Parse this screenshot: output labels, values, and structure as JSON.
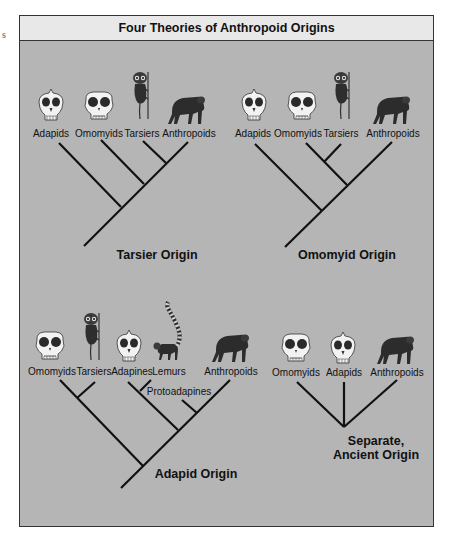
{
  "edge_fragment": "s",
  "title": "Four Theories of Anthropoid Origins",
  "colors": {
    "panel_bg": "#b5b5b5",
    "title_bg": "#e8e8e8",
    "line": "#111111"
  },
  "trees": [
    {
      "name": "Tarsier Origin",
      "taxa": [
        {
          "label": "Adapids",
          "icon": "adapid-skull-icon"
        },
        {
          "label": "Omomyids",
          "icon": "omomyid-skull-icon"
        },
        {
          "label": "Tarsiers",
          "icon": "tarsier-icon"
        },
        {
          "label": "Anthropoids",
          "icon": "chimpanzee-icon"
        }
      ],
      "topology": "(Adapids,(Omomyids,(Tarsiers,Anthropoids)))"
    },
    {
      "name": "Omomyid Origin",
      "taxa": [
        {
          "label": "Adapids",
          "icon": "adapid-skull-icon"
        },
        {
          "label": "Omomyids",
          "icon": "omomyid-skull-icon"
        },
        {
          "label": "Tarsiers",
          "icon": "tarsier-icon"
        },
        {
          "label": "Anthropoids",
          "icon": "chimpanzee-icon"
        }
      ],
      "topology": "(Adapids,((Omomyids,Tarsiers),Anthropoids))"
    },
    {
      "name": "Adapid Origin",
      "taxa": [
        {
          "label": "Omomyids",
          "icon": "omomyid-skull-icon"
        },
        {
          "label": "Tarsiers",
          "icon": "tarsier-icon"
        },
        {
          "label": "Adapines",
          "icon": "adapid-skull-icon"
        },
        {
          "label": "Lemurs",
          "icon": "lemur-icon"
        },
        {
          "label": "Anthropoids",
          "icon": "chimpanzee-icon"
        }
      ],
      "internal_label": "Protoadapines",
      "topology": "((Omomyids,Tarsiers),((Adapines,Lemurs),(Protoadapines,Anthropoids)))"
    },
    {
      "name_line1": "Separate,",
      "name_line2": "Ancient Origin",
      "taxa": [
        {
          "label": "Omomyids",
          "icon": "omomyid-skull-icon"
        },
        {
          "label": "Adapids",
          "icon": "adapid-skull-icon"
        },
        {
          "label": "Anthropoids",
          "icon": "chimpanzee-icon"
        }
      ],
      "topology": "(Omomyids,Adapids,Anthropoids)"
    }
  ]
}
